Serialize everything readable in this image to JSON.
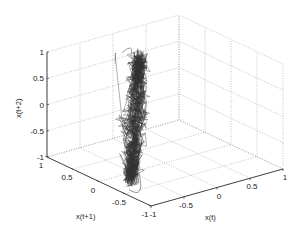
{
  "chart_data": {
    "type": "line3d",
    "title": "",
    "xlabel": "x(t)",
    "ylabel": "x(t+1)",
    "zlabel": "x(t+2)",
    "xlim": [
      -1,
      1
    ],
    "ylim": [
      -1,
      1
    ],
    "zlim": [
      -1,
      1
    ],
    "xticks": [
      "-1",
      "-0.5",
      "0",
      "0.5",
      "1"
    ],
    "yticks": [
      "-1",
      "-0.5",
      "0",
      "0.5",
      "1"
    ],
    "zticks": [
      "-1",
      "-0.5",
      "0",
      "0.5",
      "1"
    ],
    "grid": true,
    "line_color": "#333333",
    "grid_color": "#9a9a9a",
    "attractor": {
      "extent_x": [
        -0.95,
        0.05
      ],
      "extent_y": [
        -0.6,
        0.6
      ],
      "extent_z": [
        -1.0,
        1.0
      ],
      "shape": "narrow elongated ellipsoid tilted along the x(t)=x(t+1)=x(t+2) diagonal, densely filled"
    }
  }
}
